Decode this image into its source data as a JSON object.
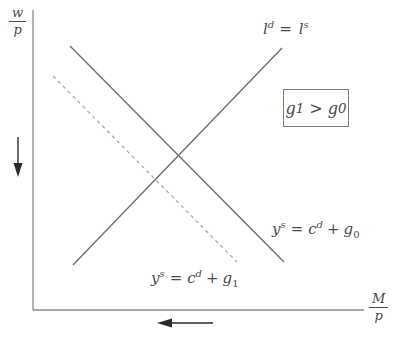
{
  "diagram": {
    "y_axis_label": {
      "numerator": "w",
      "denominator": "p"
    },
    "x_axis_label": {
      "numerator": "M",
      "denominator": "p"
    },
    "labor_market_label": {
      "lhs_base": "l",
      "lhs_sup": "d",
      "relation": "=",
      "rhs_base": "l",
      "rhs_sup": "s"
    },
    "supply_g0_label": {
      "lhs_base": "y",
      "lhs_sup": "s",
      "relation": "=",
      "term1_base": "c",
      "term1_sup": "d",
      "operator": "+",
      "term2_base": "g",
      "term2_sub": "0"
    },
    "supply_g1_label": {
      "lhs_base": "y",
      "lhs_sup": "s",
      "relation": "=",
      "term1_base": "c",
      "term1_sup": "d",
      "operator": "+",
      "term2_base": "g",
      "term2_sub": "1"
    },
    "annotation_box": {
      "lhs_base": "g",
      "lhs_sub": "1",
      "relation": ">",
      "rhs_base": "g",
      "rhs_sub": "0"
    },
    "curves": [
      {
        "name": "labor-market-equilibrium",
        "style": "solid",
        "slope": "upward"
      },
      {
        "name": "goods-supply-g0",
        "style": "solid",
        "slope": "downward"
      },
      {
        "name": "goods-supply-g1",
        "style": "dashed",
        "slope": "downward"
      }
    ],
    "colors": {
      "background": "#ffffff",
      "axis": "#8a8a8a",
      "solid_line": "#6b6b6b",
      "dashed_line": "#a8a49e",
      "arrow": "#2b2b2b",
      "text": "#4a4a4a",
      "box_border": "#7a7a7a"
    }
  }
}
